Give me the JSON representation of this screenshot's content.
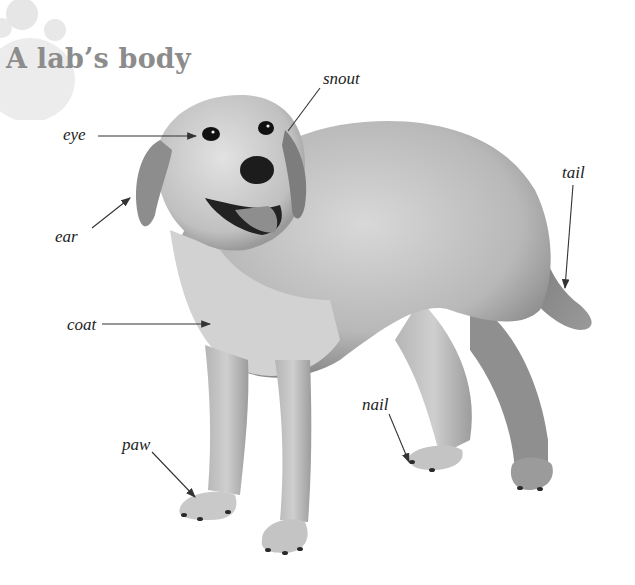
{
  "page": {
    "title": "A lab’s body",
    "colors": {
      "title": "#8c8c8c",
      "paw_decor": "#e3e3e3",
      "label_text": "#222222",
      "arrow": "#333333",
      "dog_fur_light": "#d6d6d6",
      "dog_fur_mid": "#a9a9a9",
      "dog_fur_dark": "#6e6e6e"
    }
  },
  "illustration": {
    "subject": "Labrador retriever (grayscale photo)",
    "labels": [
      {
        "id": "eye",
        "text": "eye"
      },
      {
        "id": "ear",
        "text": "ear"
      },
      {
        "id": "snout",
        "text": "snout"
      },
      {
        "id": "tail",
        "text": "tail"
      },
      {
        "id": "coat",
        "text": "coat"
      },
      {
        "id": "nail",
        "text": "nail"
      },
      {
        "id": "paw",
        "text": "paw"
      }
    ]
  }
}
